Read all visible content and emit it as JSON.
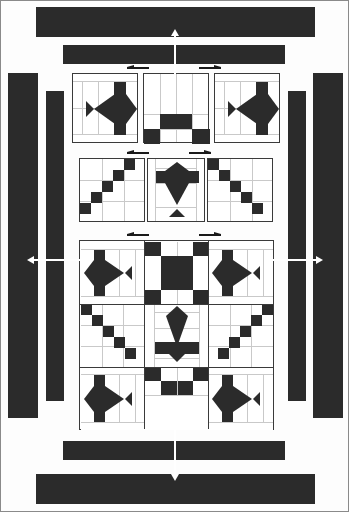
{
  "document": {
    "kind": "quilt-assembly-diagram",
    "title": "Quilt block assembly diagram",
    "background_color": "#fdfdfd",
    "fabric_dark_color": "#2b2b2b",
    "fabric_light_color": "#ffffff",
    "seam_line_color": "#c9c9c9",
    "block_outline_color": "#3a3a3a",
    "arrow_color_dark": "#1a1a1a",
    "arrow_color_light": "#ffffff"
  },
  "sashing": {
    "label": "border and sashing strips",
    "strips": [
      {
        "name": "top-outer-border-strip",
        "orientation": "horizontal",
        "x": 35,
        "y": 6,
        "w": 279,
        "h": 30
      },
      {
        "name": "top-inner-sashing-strip",
        "orientation": "horizontal",
        "x": 62,
        "y": 44,
        "w": 222,
        "h": 19
      },
      {
        "name": "left-outer-border-strip",
        "orientation": "vertical",
        "x": 7,
        "y": 72,
        "w": 30,
        "h": 345
      },
      {
        "name": "left-inner-sashing-strip",
        "orientation": "vertical",
        "x": 45,
        "y": 90,
        "w": 18,
        "h": 310
      },
      {
        "name": "right-inner-sashing-strip",
        "orientation": "vertical",
        "x": 287,
        "y": 90,
        "w": 18,
        "h": 310
      },
      {
        "name": "right-outer-border-strip",
        "orientation": "vertical",
        "x": 312,
        "y": 72,
        "w": 30,
        "h": 345
      },
      {
        "name": "bottom-inner-sashing-strip",
        "orientation": "horizontal",
        "x": 62,
        "y": 440,
        "w": 222,
        "h": 19
      },
      {
        "name": "bottom-outer-border-strip",
        "orientation": "horizontal",
        "x": 35,
        "y": 473,
        "w": 279,
        "h": 30
      }
    ]
  },
  "assembly_arrows": {
    "label": "assembly direction arrows",
    "large": [
      {
        "name": "top-assembly-arrow",
        "direction": "up",
        "x": 173,
        "y": 30,
        "length": 60
      },
      {
        "name": "bottom-assembly-arrow",
        "direction": "down",
        "x": 173,
        "y": 425,
        "length": 60
      },
      {
        "name": "left-assembly-arrow",
        "direction": "left",
        "y": 258,
        "x": 30,
        "length": 52
      },
      {
        "name": "right-assembly-arrow",
        "direction": "right",
        "y": 258,
        "x": 268,
        "length": 52
      }
    ],
    "small": [
      {
        "name": "row1-left-orientation-arrow",
        "direction": "left",
        "x": 128,
        "y": 66
      },
      {
        "name": "row1-right-orientation-arrow",
        "direction": "right",
        "x": 203,
        "y": 66
      },
      {
        "name": "row2-left-orientation-arrow",
        "direction": "left",
        "x": 128,
        "y": 151
      },
      {
        "name": "row2-right-orientation-arrow",
        "direction": "right",
        "x": 193,
        "y": 151
      },
      {
        "name": "row3-left-orientation-arrow",
        "direction": "left",
        "x": 128,
        "y": 233
      },
      {
        "name": "row3-right-orientation-arrow",
        "direction": "right",
        "x": 203,
        "y": 233
      }
    ]
  },
  "rows": [
    {
      "name": "row-1",
      "label": "top unit row",
      "blocks": [
        {
          "name": "block-fish-top-left",
          "motif": "fish",
          "orientation": "horizontal-right",
          "x": 71,
          "y": 72,
          "w": 66,
          "h": 70
        },
        {
          "name": "block-checker-top-center",
          "motif": "four-patch-corner",
          "orientation": "none",
          "x": 142,
          "y": 72,
          "w": 66,
          "h": 70
        },
        {
          "name": "block-fish-top-right",
          "motif": "fish",
          "orientation": "horizontal-right",
          "x": 213,
          "y": 72,
          "w": 66,
          "h": 70
        }
      ]
    },
    {
      "name": "row-2",
      "label": "middle unit row",
      "blocks": [
        {
          "name": "block-diagonal-left",
          "motif": "diagonal-checker",
          "orientation": "down-right",
          "x": 78,
          "y": 157,
          "w": 66,
          "h": 64
        },
        {
          "name": "block-fish-center",
          "motif": "fish",
          "orientation": "vertical-down",
          "x": 146,
          "y": 157,
          "w": 58,
          "h": 64
        },
        {
          "name": "block-diagonal-right",
          "motif": "diagonal-checker",
          "orientation": "down-left",
          "x": 206,
          "y": 157,
          "w": 66,
          "h": 64
        }
      ]
    },
    {
      "name": "row-3",
      "label": "completed quilt center assembly",
      "blocks": [
        {
          "name": "assembled-quilt-center",
          "motif": "nine-block-medallion",
          "orientation": "none",
          "x": 78,
          "y": 239,
          "w": 195,
          "h": 190
        }
      ]
    }
  ],
  "assembled_block": {
    "name": "assembled-quilt-center",
    "grid": "3x3",
    "cells": [
      {
        "name": "corner-fish-top-left",
        "motif": "fish",
        "orientation": "horizontal-left"
      },
      {
        "name": "center-checker-top",
        "motif": "four-patch-corner",
        "orientation": "none"
      },
      {
        "name": "corner-fish-top-right",
        "motif": "fish",
        "orientation": "horizontal-left"
      },
      {
        "name": "side-diagonal-left",
        "motif": "diagonal-checker",
        "orientation": "down-right"
      },
      {
        "name": "center-fish",
        "motif": "fish",
        "orientation": "vertical-down"
      },
      {
        "name": "side-diagonal-right",
        "motif": "diagonal-checker",
        "orientation": "down-left"
      },
      {
        "name": "corner-fish-bottom-left",
        "motif": "fish",
        "orientation": "horizontal-left"
      },
      {
        "name": "center-checker-bottom",
        "motif": "four-patch-corner",
        "orientation": "none"
      },
      {
        "name": "corner-fish-bottom-right",
        "motif": "fish",
        "orientation": "horizontal-left"
      }
    ]
  }
}
